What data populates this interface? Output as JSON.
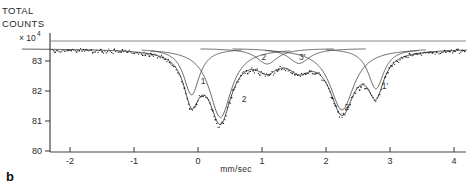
{
  "panel": {
    "label": "b"
  },
  "yaxis": {
    "title_line1": "TOTAL",
    "title_line2": "COUNTS",
    "scale_prefix": "× 10",
    "scale_exponent": "4",
    "ticks": [
      "83",
      "82",
      "81",
      "80"
    ],
    "tick_values": [
      83,
      82,
      81,
      80
    ],
    "range": [
      80,
      83.6
    ]
  },
  "xaxis": {
    "label": "mm/sec",
    "ticks": [
      "-2",
      "-1",
      "0",
      "1",
      "2",
      "3",
      "4"
    ],
    "tick_values": [
      -2,
      -1,
      0,
      1,
      2,
      3,
      4
    ],
    "range": [
      -2.75,
      4.2
    ]
  },
  "curve_labels": [
    {
      "text": "1",
      "x": 0.08,
      "y": 82.25
    },
    {
      "text": "2",
      "x": 0.72,
      "y": 81.62
    },
    {
      "text": "2",
      "x": 1.03,
      "y": 83.05
    },
    {
      "text": "3'",
      "x": 1.63,
      "y": 83.05
    },
    {
      "text": "2'",
      "x": 2.34,
      "y": 81.38
    },
    {
      "text": "1'",
      "x": 2.92,
      "y": 82.08
    }
  ],
  "chart_data": {
    "type": "line",
    "title": "",
    "xlabel": "mm/sec",
    "ylabel": "TOTAL COUNTS × 10⁴",
    "xlim": [
      -2.75,
      4.2
    ],
    "ylim": [
      80.0,
      83.6
    ],
    "grid": false,
    "legend": "none",
    "baseline": 83.42,
    "components": [
      {
        "name": "1",
        "center": -0.1,
        "depth": 1.55,
        "width": 0.3
      },
      {
        "name": "2",
        "center": 0.35,
        "depth": 2.3,
        "width": 0.42
      },
      {
        "name": "2",
        "center": 1.08,
        "depth": 0.52,
        "width": 0.4
      },
      {
        "name": "3'",
        "center": 1.58,
        "depth": 0.5,
        "width": 0.4
      },
      {
        "name": "2'",
        "center": 2.25,
        "depth": 2.05,
        "width": 0.46
      },
      {
        "name": "1'",
        "center": 2.78,
        "depth": 1.35,
        "width": 0.3
      }
    ],
    "series": [
      {
        "name": "experimental-points",
        "style": "dots"
      },
      {
        "name": "fitted-envelope",
        "style": "line"
      },
      {
        "name": "sub-components",
        "style": "line"
      }
    ]
  }
}
